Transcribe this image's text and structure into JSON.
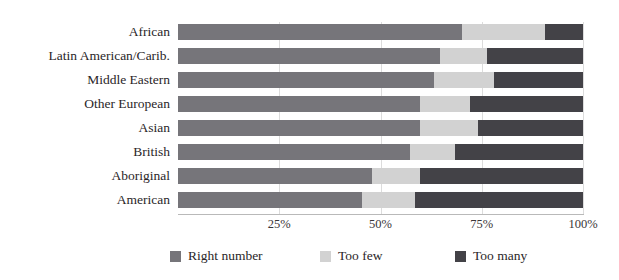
{
  "chart_data": {
    "type": "bar",
    "orientation": "horizontal",
    "stacked": true,
    "stack_normalized_percent": true,
    "title": "",
    "xlabel": "",
    "ylabel": "",
    "xlim": [
      0,
      100
    ],
    "xticks": [
      25,
      50,
      75,
      100
    ],
    "xtick_labels": [
      "25%",
      "50%",
      "75%",
      "100%"
    ],
    "grid": true,
    "grid_axis": "x",
    "legend_position": "bottom",
    "categories": [
      "African",
      "Latin American/Carib.",
      "Middle Eastern",
      "Other European",
      "Asian",
      "British",
      "Aboriginal",
      "American"
    ],
    "series": [
      {
        "name": "Right number",
        "color": "#76757a",
        "values": [
          70.0,
          64.7,
          63.2,
          59.8,
          59.8,
          57.3,
          47.9,
          45.4
        ]
      },
      {
        "name": "Too few",
        "color": "#d2d2d2",
        "values": [
          20.6,
          11.6,
          14.8,
          12.3,
          14.3,
          11.1,
          11.9,
          13.1
        ]
      },
      {
        "name": "Too many",
        "color": "#434247",
        "values": [
          9.4,
          23.7,
          22.0,
          27.9,
          25.9,
          31.6,
          40.2,
          41.5
        ]
      }
    ]
  },
  "legend": {
    "items": [
      {
        "label": "Right number",
        "color": "#76757a"
      },
      {
        "label": "Too few",
        "color": "#d2d2d2"
      },
      {
        "label": "Too many",
        "color": "#434247"
      }
    ]
  },
  "colors": {
    "right_number": "#76757a",
    "too_few": "#d2d2d2",
    "too_many": "#434247",
    "gridline": "#dcdcdc",
    "axis": "#b9b9b9",
    "text": "#2a2628",
    "background": "#ffffff"
  }
}
